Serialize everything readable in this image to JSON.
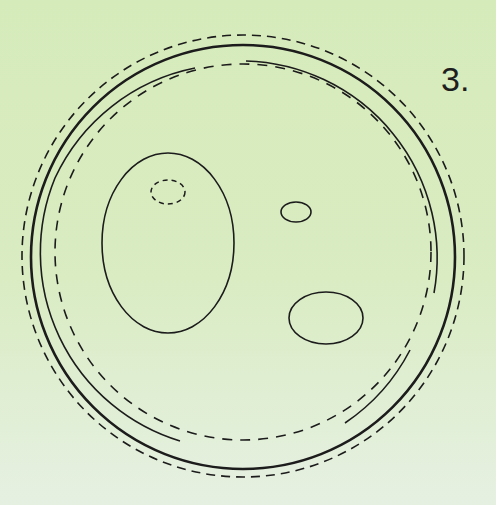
{
  "figure": {
    "label": "3.",
    "background": "#d8ecbf",
    "stroke_color": "#1c1c1c"
  },
  "shapes": {
    "outer_dashed_circle": {
      "cx": 243,
      "cy": 256,
      "r": 221
    },
    "thick_solid_circle": {
      "cx": 243,
      "cy": 257,
      "r": 212
    },
    "inner_solid_arcs": {
      "cx": 243,
      "cy": 257,
      "r": 197
    },
    "inner_dashed_circle": {
      "cx": 243,
      "cy": 252,
      "r": 188
    },
    "large_oval": {
      "cx": 168,
      "cy": 243,
      "rx": 66,
      "ry": 90
    },
    "dashed_small_oval": {
      "cx": 168,
      "cy": 192,
      "rx": 17,
      "ry": 12
    },
    "small_oval": {
      "cx": 296,
      "cy": 212,
      "rx": 15,
      "ry": 10
    },
    "medium_oval": {
      "cx": 326,
      "cy": 318,
      "rx": 37,
      "ry": 26
    }
  }
}
